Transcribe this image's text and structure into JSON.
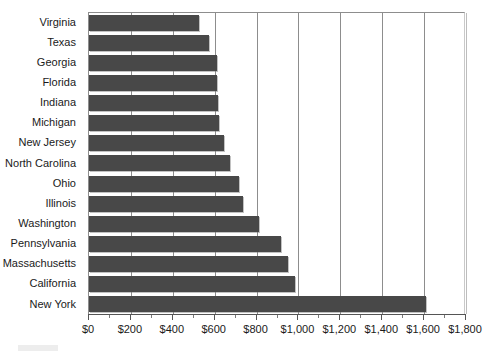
{
  "chart_data": {
    "type": "bar",
    "orientation": "horizontal",
    "title": "",
    "xlabel": "",
    "ylabel": "",
    "xlim": [
      0,
      1800
    ],
    "xticks": [
      0,
      200,
      400,
      600,
      800,
      1000,
      1200,
      1400,
      1600,
      1800
    ],
    "xticklabels": [
      "$0",
      "$200",
      "$400",
      "$600",
      "$800",
      "$1,000",
      "$1,200",
      "$1,400",
      "$1,600",
      "$1,800"
    ],
    "grid": true,
    "grid_axis": "x",
    "legend": null,
    "bar_color": "#484848",
    "categories": [
      "Virginia",
      "Texas",
      "Georgia",
      "Florida",
      "Indiana",
      "Michigan",
      "New Jersey",
      "North Carolina",
      "Ohio",
      "Illinois",
      "Washington",
      "Pennsylvania",
      "Massachusetts",
      "California",
      "New York"
    ],
    "values": [
      525,
      575,
      610,
      610,
      615,
      620,
      645,
      675,
      715,
      735,
      810,
      915,
      950,
      985,
      1610
    ]
  },
  "axis": {
    "x_tick_labels": [
      "$0",
      "$200",
      "$400",
      "$600",
      "$800",
      "$1,000",
      "$1,200",
      "$1,400",
      "$1,600",
      "$1,800"
    ]
  },
  "title_remnant": ""
}
